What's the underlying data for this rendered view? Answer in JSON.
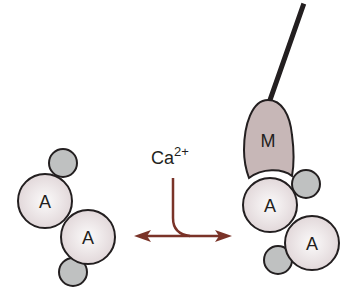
{
  "diagram": {
    "ion_label": "Ca",
    "ion_charge": "2+",
    "left_complex": {
      "actin_labels": [
        "A",
        "A"
      ]
    },
    "right_complex": {
      "myosin_label": "M",
      "actin_labels": [
        "A",
        "A"
      ]
    }
  },
  "colors": {
    "arrow": "#7a3328",
    "actin_fill": "#ece4e6",
    "small_subunit_fill": "#bfc1c1",
    "myosin_fill": "#c7b7b7",
    "outline": "#231f20"
  }
}
